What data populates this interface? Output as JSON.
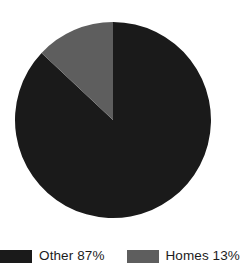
{
  "chart_data": {
    "type": "pie",
    "title": "",
    "subtitle": "",
    "categories": [
      "Other",
      "Homes"
    ],
    "values": [
      87,
      13
    ],
    "unit": "%",
    "labels": [
      "Other 87%",
      "Homes 13%"
    ],
    "colors": [
      "#1a1a1a",
      "#5e5e5e"
    ],
    "start_angle_deg": 90,
    "direction": "clockwise",
    "slices": [
      {
        "name": "Other",
        "value": 87,
        "display_value": "87%",
        "legend_text": "Other 87%",
        "color": "#1a1a1a",
        "sweep_deg": 313.2
      },
      {
        "name": "Homes",
        "value": 13,
        "display_value": "13%",
        "legend_text": "Homes 13%",
        "color": "#5e5e5e",
        "sweep_deg": 46.8
      }
    ],
    "legend": {
      "position": "bottom",
      "orientation": "horizontal",
      "entries": [
        {
          "label": "Other 87%",
          "color": "#1a1a1a"
        },
        {
          "label": "Homes 13%",
          "color": "#5e5e5e"
        }
      ]
    },
    "geometry": {
      "center_x": 113,
      "center_y": 120,
      "radius": 98
    },
    "background": "#ffffff",
    "grid": false,
    "xlabel": "",
    "ylabel": ""
  }
}
